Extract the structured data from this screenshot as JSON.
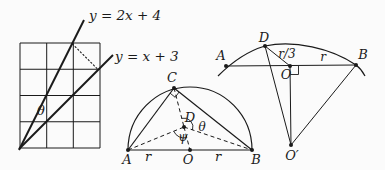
{
  "colors": {
    "ink": "#1a1a1a",
    "background": "#fbfbfb"
  },
  "figure1": {
    "line1_equation": "y = 2x + 4",
    "line2_equation": "y = x + 3",
    "angle_theta": "θ"
  },
  "figure2": {
    "labels": {
      "A": "A",
      "B": "B",
      "C": "C",
      "D": "D",
      "O": "O",
      "r_left": "r",
      "r_right": "r",
      "theta": "θ",
      "psi": "ψ"
    }
  },
  "figure3": {
    "labels": {
      "A": "A",
      "B": "B",
      "D": "D",
      "O": "O",
      "O_prime": "O′",
      "r_over_3": "r/3",
      "r": "r"
    }
  }
}
